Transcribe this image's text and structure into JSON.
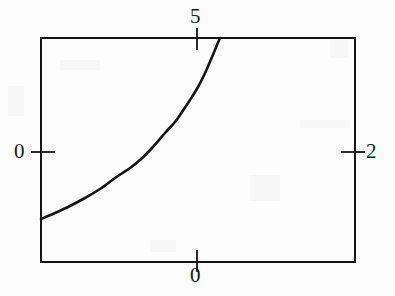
{
  "figure": {
    "background_color": "#fdfdfd",
    "ink_color": "#141414",
    "width": 395,
    "height": 296
  },
  "axes": {
    "frame": {
      "left": 41,
      "top": 38,
      "right": 355,
      "bottom": 262,
      "border_width": 2,
      "border_color": "#141414"
    },
    "ticks": {
      "top": {
        "position_px": 197,
        "label": "5"
      },
      "bottom": {
        "position_px": 197,
        "label": "0"
      },
      "left": {
        "position_px": 152,
        "label": "0"
      },
      "right": {
        "position_px": 152,
        "label": "2"
      }
    }
  },
  "chart_data": {
    "type": "line",
    "title": "",
    "xlabel": "",
    "ylabel": "",
    "grid": false,
    "legend": null,
    "x_ticks": {
      "top_axis": [
        {
          "label": "5",
          "pixel_x": 197
        }
      ],
      "bottom_axis": [
        {
          "label": "0",
          "pixel_x": 197
        }
      ]
    },
    "y_ticks": {
      "left_axis": [
        {
          "label": "0",
          "pixel_y": 152
        }
      ],
      "right_axis": [
        {
          "label": "2",
          "pixel_y": 152
        }
      ]
    },
    "series": [
      {
        "name": "curve",
        "style": "solid",
        "color": "#141414",
        "line_width": 2.6,
        "description": "monotonically increasing convex curve rising from the left edge to the top edge",
        "points_px": [
          [
            41,
            219
          ],
          [
            55,
            213
          ],
          [
            70,
            206
          ],
          [
            85,
            198
          ],
          [
            100,
            189
          ],
          [
            115,
            178
          ],
          [
            130,
            168
          ],
          [
            140,
            160
          ],
          [
            152,
            148
          ],
          [
            165,
            133
          ],
          [
            175,
            122
          ],
          [
            180,
            115
          ],
          [
            190,
            100
          ],
          [
            198,
            87
          ],
          [
            206,
            71
          ],
          [
            212,
            57
          ],
          [
            217,
            45
          ],
          [
            220,
            38
          ]
        ]
      }
    ]
  }
}
